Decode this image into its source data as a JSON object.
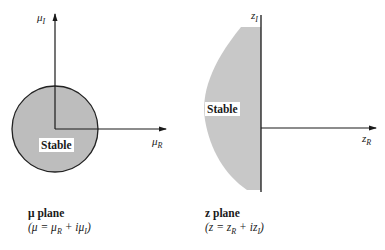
{
  "left_panel": {
    "title": "μ plane",
    "definition": "(μ = μR + iμI)",
    "vertical_axis_label": "μI",
    "horizontal_axis_label": "μR",
    "region_label": "Stable",
    "region_shape": "disk",
    "fill_color": "#bdbdbd"
  },
  "right_panel": {
    "title": "z plane",
    "definition": "(z = zR + izI)",
    "vertical_axis_label": "zI",
    "horizontal_axis_label": "zR",
    "region_label": "Stable",
    "region_shape": "left half-plane bounded region",
    "fill_color": "#c8c8c8"
  },
  "labels": {
    "mu": "μ",
    "z": "z",
    "sub_I": "I",
    "sub_R": "R",
    "mu_plane_title": "μ plane",
    "mu_plane_def": "(μ = μ",
    "mu_plane_def_mid": " + iμ",
    "mu_plane_def_end": ")",
    "z_plane_title": "z plane",
    "z_plane_def": "(z = z",
    "z_plane_def_mid": " + iz",
    "z_plane_def_end": ")",
    "stable": "Stable"
  }
}
